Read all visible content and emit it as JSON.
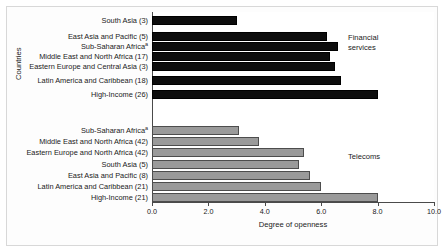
{
  "axis": {
    "x_title": "Degree of openness",
    "y_title": "Countries",
    "ticks": [
      "0.0",
      "2.0",
      "4.0",
      "6.0",
      "8.0",
      "10.0"
    ]
  },
  "annotations": {
    "financial_line1": "Financial",
    "financial_line2": "services",
    "telecoms": "Telecoms"
  },
  "labels": {
    "fin": [
      "South Asia (3)",
      "East Asia and Pacific (5)",
      "Sub-Saharan Africa",
      "Middle East and North Africa (17)",
      "Eastern Europe and Central Asia (3)",
      "Latin America and Caribbean (18)",
      "High-Income (26)"
    ],
    "fin_marks": [
      "",
      "",
      "a",
      "",
      "",
      "",
      ""
    ],
    "tel": [
      "Sub-Saharan Africa",
      "Middle East and North Africa (42)",
      "Eastern Europe and North Africa (42)",
      "South Asia (5)",
      "East Asia and Pacific (8)",
      "Latin America and Caribbean (21)",
      "High-Income (21)"
    ],
    "tel_marks": [
      "a",
      "",
      "",
      "",
      "",
      "",
      ""
    ]
  },
  "colors": {
    "financial_services": "#0d0d0d",
    "telecoms": "#9a9a9a",
    "axis": "#4a4a4a",
    "text": "#1a1a1a"
  },
  "chart_data": {
    "type": "bar",
    "orientation": "horizontal",
    "title": "",
    "xlabel": "Degree of openness",
    "ylabel": "Countries",
    "xlim": [
      0.0,
      10.0
    ],
    "xticks": [
      0.0,
      2.0,
      4.0,
      6.0,
      8.0,
      10.0
    ],
    "grid": false,
    "legend_position": "in-plot-annotation",
    "series": [
      {
        "name": "Financial services",
        "color": "#0d0d0d",
        "categories": [
          "South Asia (3)",
          "East Asia and Pacific (5)",
          "Sub-Saharan Africa (a)",
          "Middle East and North Africa (17)",
          "Eastern Europe and Central Asia (3)",
          "Latin America and Caribbean (18)",
          "High-Income (26)"
        ],
        "values": [
          3.0,
          6.2,
          6.6,
          6.3,
          6.5,
          6.7,
          8.0
        ]
      },
      {
        "name": "Telecoms",
        "color": "#9a9a9a",
        "categories": [
          "Sub-Saharan Africa (a)",
          "Middle East and North Africa (42)",
          "Eastern Europe and North Africa (42)",
          "South Asia (5)",
          "East Asia and Pacific (8)",
          "Latin America and Caribbean (21)",
          "High-Income (21)"
        ],
        "values": [
          3.1,
          3.8,
          5.4,
          5.2,
          5.6,
          6.0,
          8.0
        ]
      }
    ]
  }
}
